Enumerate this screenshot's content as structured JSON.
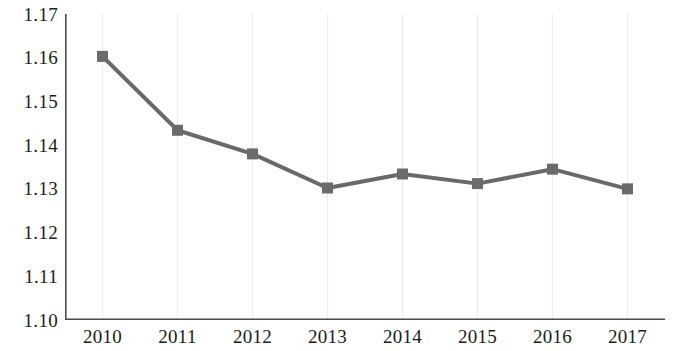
{
  "chart_data": {
    "type": "line",
    "title": "",
    "subtitle": "",
    "xlabel": "",
    "ylabel": "",
    "categories": [
      "2010",
      "2011",
      "2012",
      "2013",
      "2014",
      "2015",
      "2016",
      "2017"
    ],
    "x": [
      2010,
      2011,
      2012,
      2013,
      2014,
      2015,
      2016,
      2017
    ],
    "values": [
      1.1603,
      1.1434,
      1.138,
      1.1302,
      1.1334,
      1.1312,
      1.1345,
      1.13
    ],
    "series": [
      {
        "name": "",
        "values": [
          1.1603,
          1.1434,
          1.138,
          1.1302,
          1.1334,
          1.1312,
          1.1345,
          1.13
        ]
      }
    ],
    "ylim": [
      1.1,
      1.17
    ],
    "yticks": [
      1.1,
      1.11,
      1.12,
      1.13,
      1.14,
      1.15,
      1.16,
      1.17
    ],
    "ytick_labels": [
      "1.10",
      "1.11",
      "1.12",
      "1.13",
      "1.14",
      "1.15",
      "1.16",
      "1.17"
    ],
    "xtick_labels": [
      "2010",
      "2011",
      "2012",
      "2013",
      "2014",
      "2015",
      "2016",
      "2017"
    ],
    "grid": {
      "vertical": true,
      "horizontal": false,
      "color": "#ededed"
    },
    "legend": {
      "visible": false,
      "position": "none",
      "entries": []
    },
    "marker": {
      "shape": "square",
      "size": 11,
      "color": "#6b6b6b"
    },
    "line": {
      "color": "#696969",
      "width": 4
    },
    "axis": {
      "color": "#4a4a4a",
      "tick_marks": true,
      "tick_side": "outside"
    }
  },
  "colors": {
    "series": "#696969",
    "marker": "#6b6b6b",
    "axis": "#4a4a4a",
    "grid": "#ededed",
    "text": "#1c1c1c",
    "background": "#ffffff"
  }
}
